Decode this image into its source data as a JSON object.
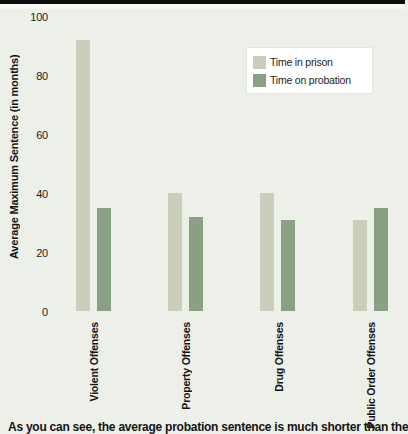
{
  "chart_data": {
    "type": "bar",
    "categories": [
      "Violent Offenses",
      "Property Offenses",
      "Drug Offenses",
      "Public Order Offenses"
    ],
    "series": [
      {
        "name": "Time in prison",
        "color": "#c9cfbb",
        "values": [
          92,
          40,
          40,
          31
        ]
      },
      {
        "name": "Time on probation",
        "color": "#8aa083",
        "values": [
          35,
          32,
          31,
          35
        ]
      }
    ],
    "title": "",
    "xlabel": "",
    "ylabel": "Average Maximum Sentence (in months)",
    "ylim": [
      0,
      100
    ],
    "yticks": [
      0,
      20,
      40,
      60,
      80,
      100
    ],
    "grid": false,
    "legend_position": "upper right"
  },
  "caption": {
    "text": "As you can see, the average probation sentence is much shorter than the"
  },
  "colors": {
    "background": "#edefe9",
    "banner": "#0d0d0d",
    "legend_box": "#ffffff",
    "text": "#141414",
    "prison_bar": "#c9cfbb",
    "probation_bar": "#8aa083"
  }
}
